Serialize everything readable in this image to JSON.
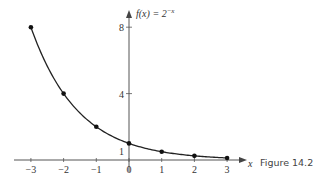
{
  "chart_data": {
    "type": "line",
    "function_label": "f(x) = 2",
    "function_exponent": "−x",
    "xlabel": "x",
    "ylabel": "",
    "x": [
      -3,
      -2,
      -1,
      0,
      1,
      2,
      3
    ],
    "values": [
      8,
      4,
      2,
      1,
      0.5,
      0.25,
      0.125
    ],
    "markers": true,
    "x_ticks": [
      "−3",
      "−2",
      "−1",
      "0",
      "1",
      "2",
      "3"
    ],
    "y_ticks": [
      {
        "value": 8,
        "label": "8"
      },
      {
        "value": 4,
        "label": "4"
      },
      {
        "value": 1,
        "label": "1"
      }
    ],
    "xlim": [
      -3.5,
      3.5
    ],
    "ylim": [
      0,
      8.8
    ],
    "grid": false,
    "legend": "none"
  },
  "caption": "Figure 14.2"
}
